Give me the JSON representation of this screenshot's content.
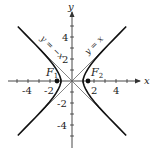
{
  "diagram": {
    "type": "hyperbola",
    "equation": "x^2 - y^2 = 1",
    "axes": {
      "x_label": "x",
      "y_label": "y",
      "x_ticks": [
        "-4",
        "-2",
        "2",
        "4"
      ],
      "y_ticks": [
        "4",
        "2",
        "-2",
        "-4"
      ],
      "x_range": [
        -5.5,
        5.5
      ],
      "y_range": [
        -5.5,
        5.5
      ]
    },
    "asymptotes": [
      {
        "label": "y = −x"
      },
      {
        "label": "y = x"
      }
    ],
    "foci": [
      {
        "label": "F",
        "subscript": "1",
        "x": -1.414,
        "y": 0
      },
      {
        "label": "F",
        "subscript": "2",
        "x": 1.414,
        "y": 0
      }
    ],
    "colors": {
      "curve": "#111111",
      "asymptote": "#555555",
      "axis": "#333333"
    }
  }
}
